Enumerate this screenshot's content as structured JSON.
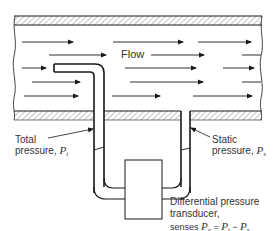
{
  "diagram": {
    "labels": {
      "flow": "Flow",
      "total_pressure": {
        "line1": "Total",
        "line2": "pressure, ",
        "symbol": "P",
        "subscript": "t"
      },
      "static_pressure": {
        "line1": "Static",
        "line2": "pressure, ",
        "symbol": "P",
        "subscript": "s"
      },
      "transducer": {
        "line1": "Differential pressure",
        "line2": "transducer,",
        "line3_prefix": "senses ",
        "eq_lhs": "P",
        "eq_lhs_sub": "v",
        "eq_eq": " = ",
        "eq_a": "P",
        "eq_a_sub": "t",
        "eq_minus": " − ",
        "eq_b": "P",
        "eq_b_sub": "s"
      }
    },
    "components": [
      "pipe-wall-top",
      "pipe-wall-bottom",
      "pitot-tube",
      "static-tap",
      "u-tube-left",
      "u-tube-right",
      "differential-pressure-transducer",
      "flow-arrows"
    ],
    "colors": {
      "line": "#1a1a1a",
      "hatch": "#999999",
      "text": "#333333"
    }
  }
}
